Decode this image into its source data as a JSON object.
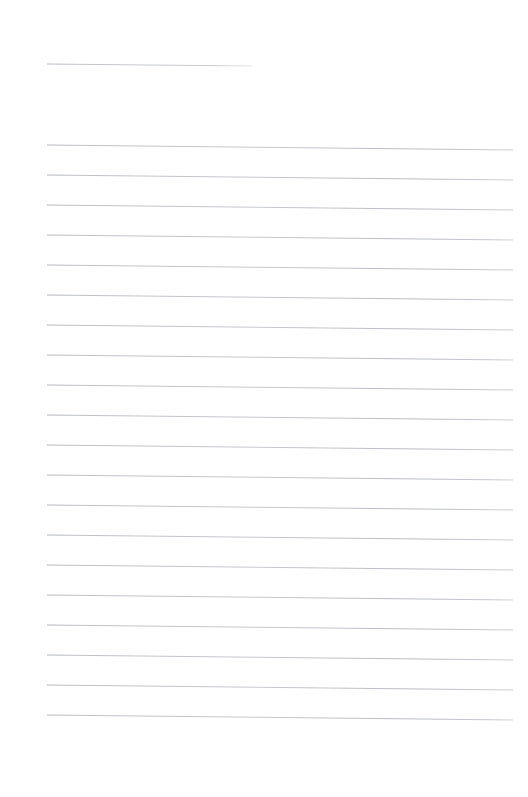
{
  "page": {
    "kind": "scanned-blank-ruled-paper",
    "title": "Blank Ruled Page",
    "width": 528,
    "height": 797,
    "background_color": "#ffffff",
    "paper_tone_color": "#fdfdfd",
    "visible_text": "",
    "text_content_present": false
  },
  "rules": {
    "ink_color": "#b2b6bb",
    "ink_color_light": "#c9ccd0",
    "stroke_width": 0.9,
    "line_spacing": 30,
    "left_margin_x": 47,
    "right_margin_x": 513,
    "skew_drop_px": 5,
    "header_rule": {
      "name": "header-rule",
      "x1": 47,
      "y1": 64,
      "x2": 252,
      "y2": 66,
      "label": ""
    },
    "body_first_y": 145,
    "body_line_count": 20,
    "body_lines": [
      {
        "index": 1,
        "x1": 47,
        "y1": 145,
        "x2": 513,
        "y2": 150
      },
      {
        "index": 2,
        "x1": 47,
        "y1": 175,
        "x2": 513,
        "y2": 180
      },
      {
        "index": 3,
        "x1": 47,
        "y1": 205,
        "x2": 513,
        "y2": 210
      },
      {
        "index": 4,
        "x1": 47,
        "y1": 235,
        "x2": 513,
        "y2": 240
      },
      {
        "index": 5,
        "x1": 47,
        "y1": 265,
        "x2": 513,
        "y2": 270
      },
      {
        "index": 6,
        "x1": 47,
        "y1": 295,
        "x2": 513,
        "y2": 300
      },
      {
        "index": 7,
        "x1": 47,
        "y1": 325,
        "x2": 513,
        "y2": 330
      },
      {
        "index": 8,
        "x1": 47,
        "y1": 355,
        "x2": 513,
        "y2": 360
      },
      {
        "index": 9,
        "x1": 47,
        "y1": 385,
        "x2": 513,
        "y2": 390
      },
      {
        "index": 10,
        "x1": 47,
        "y1": 415,
        "x2": 513,
        "y2": 420
      },
      {
        "index": 11,
        "x1": 47,
        "y1": 445,
        "x2": 513,
        "y2": 450
      },
      {
        "index": 12,
        "x1": 47,
        "y1": 475,
        "x2": 513,
        "y2": 480
      },
      {
        "index": 13,
        "x1": 47,
        "y1": 505,
        "x2": 513,
        "y2": 510
      },
      {
        "index": 14,
        "x1": 47,
        "y1": 535,
        "x2": 513,
        "y2": 540
      },
      {
        "index": 15,
        "x1": 47,
        "y1": 565,
        "x2": 513,
        "y2": 570
      },
      {
        "index": 16,
        "x1": 47,
        "y1": 595,
        "x2": 513,
        "y2": 600
      },
      {
        "index": 17,
        "x1": 47,
        "y1": 625,
        "x2": 513,
        "y2": 630
      },
      {
        "index": 18,
        "x1": 47,
        "y1": 655,
        "x2": 513,
        "y2": 660
      },
      {
        "index": 19,
        "x1": 47,
        "y1": 685,
        "x2": 513,
        "y2": 690
      },
      {
        "index": 20,
        "x1": 47,
        "y1": 715,
        "x2": 513,
        "y2": 720
      }
    ]
  },
  "margins": {
    "top_blank_height": 64,
    "bottom_blank_from_y": 735,
    "left_blank_width": 47,
    "right_blank_width": 15
  }
}
